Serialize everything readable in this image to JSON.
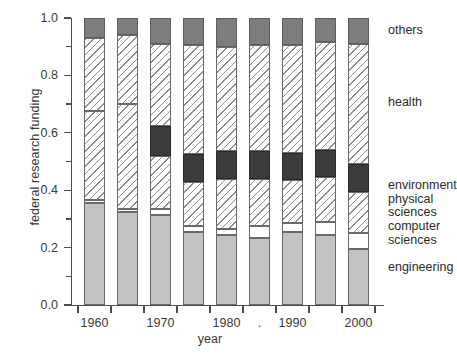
{
  "chart_data": {
    "type": "bar",
    "subtype": "stacked-bar-proportional",
    "title": "",
    "xlabel": "year",
    "ylabel": "federal research funding",
    "categories": [
      "1960",
      "1965",
      "1970",
      "1975",
      "1980",
      "1985",
      "1990",
      "1995",
      "2000"
    ],
    "x_tick_labels": [
      "1960",
      "",
      "1970",
      "",
      "1980",
      ".",
      "1990",
      "",
      "2000"
    ],
    "x_tick_labels_shown": [
      "1960",
      "1970",
      "1980",
      ".",
      "1990",
      "2000"
    ],
    "y_tick_labels": [
      "0.0",
      "0.2",
      "0.4",
      "0.6",
      "0.8",
      "1.0"
    ],
    "y_tick_values": [
      0.0,
      0.2,
      0.4,
      0.6,
      0.8,
      1.0
    ],
    "y_minor_ticks": [
      0.1,
      0.3,
      0.5,
      0.7,
      0.9
    ],
    "ylim": [
      0.0,
      1.0
    ],
    "grid": false,
    "legend_position": "right-inline-labels",
    "series": [
      {
        "name": "engineering",
        "fill": "solid-gray",
        "color": "#c3c3c3",
        "values": [
          0.355,
          0.325,
          0.315,
          0.255,
          0.245,
          0.235,
          0.255,
          0.245,
          0.195
        ]
      },
      {
        "name": "computer sciences",
        "fill": "white",
        "color": "#ffffff",
        "values": [
          0.01,
          0.01,
          0.02,
          0.02,
          0.02,
          0.04,
          0.03,
          0.045,
          0.055
        ]
      },
      {
        "name": "physical sciences",
        "fill": "hatched",
        "color": "#ffffff",
        "values": [
          0.31,
          0.365,
          0.185,
          0.155,
          0.175,
          0.165,
          0.15,
          0.155,
          0.145
        ]
      },
      {
        "name": "environment",
        "fill": "solid-dark",
        "color": "#3b3b3b",
        "values": [
          0.0,
          0.0,
          0.105,
          0.095,
          0.095,
          0.095,
          0.095,
          0.095,
          0.095
        ]
      },
      {
        "name": "health",
        "fill": "hatched",
        "color": "#ffffff",
        "values": [
          0.255,
          0.24,
          0.285,
          0.38,
          0.365,
          0.37,
          0.375,
          0.375,
          0.42
        ]
      },
      {
        "name": "others",
        "fill": "solid-mid-gray",
        "color": "#7d7d7d",
        "values": [
          0.07,
          0.06,
          0.09,
          0.095,
          0.1,
          0.095,
          0.095,
          0.085,
          0.09
        ]
      }
    ],
    "category_labels": [
      {
        "text": "others",
        "y": 0.955
      },
      {
        "text": "health",
        "y": 0.705
      },
      {
        "text": "environment",
        "y": 0.415
      },
      {
        "text": "physical sciences",
        "y": 0.345
      },
      {
        "text": "computer sciences",
        "y": 0.25
      },
      {
        "text": "engineering",
        "y": 0.13
      }
    ],
    "colors": {
      "engineering": "#c3c3c3",
      "computer_sciences": "#ffffff",
      "physical_sciences": "#ffffff",
      "environment": "#3b3b3b",
      "health": "#ffffff",
      "others": "#7d7d7d",
      "axis": "#4d4d4d",
      "text": "#2c2c2c",
      "hatch": "#8d8d8d"
    }
  }
}
